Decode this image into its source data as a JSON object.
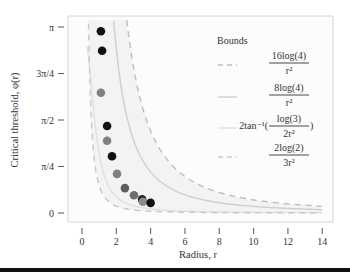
{
  "chart_data": {
    "type": "scatter",
    "title": "",
    "xlabel": "Radius, r",
    "ylabel": "Critical threshold, φ(r)",
    "xlim": [
      -0.8,
      14.6
    ],
    "ylim": [
      -0.15,
      3.26
    ],
    "xticks": [
      0,
      2,
      4,
      6,
      8,
      10,
      12,
      14
    ],
    "xtick_labels": [
      "0",
      "2",
      "4",
      "6",
      "8",
      "10",
      "12",
      "14"
    ],
    "yticks": [
      0,
      0.7854,
      1.5708,
      2.3562,
      3.1416
    ],
    "ytick_labels": [
      "0",
      "π/4",
      "π/2",
      "3π/4",
      "π"
    ],
    "grid": false,
    "legend": {
      "title": "Bounds",
      "position": "upper right",
      "entries": [
        {
          "label_num": "16log(4)",
          "label_den": "r²",
          "prefix": "",
          "suffix": "",
          "style": "dashed",
          "color": "#bdbdbd"
        },
        {
          "label_num": "8log(4)",
          "label_den": "r²",
          "prefix": "",
          "suffix": "",
          "style": "solid",
          "color": "#cfcfcf"
        },
        {
          "label_num": "log(3)",
          "label_den": "2r²",
          "prefix": "2tan⁻¹(",
          "suffix": ")",
          "style": "solid",
          "color": "#e0e0e0"
        },
        {
          "label_num": "2log(2)",
          "label_den": "3r²",
          "prefix": "",
          "suffix": "",
          "style": "dashed",
          "color": "#c8c8c8"
        }
      ]
    },
    "curves": [
      {
        "name": "16log(4)/r^2",
        "formula": "16*ln(4)/r^2",
        "style": "dashed",
        "color": "#bdbdbd"
      },
      {
        "name": "8log(4)/r^2",
        "formula": "8*ln(4)/r^2",
        "style": "solid",
        "color": "#cfcfcf"
      },
      {
        "name": "2tan^-1(log(3)/(2r^2))",
        "formula": "2*atan(ln(3)/(2r^2))",
        "style": "solid",
        "color": "#e0e0e0"
      },
      {
        "name": "2log(2)/(3r^2)",
        "formula": "2*ln(2)/(3r^2)",
        "style": "dashed",
        "color": "#c8c8c8"
      }
    ],
    "shaded_band": {
      "between": [
        "2log(2)/(3r^2)",
        "16log(4)/r^2"
      ],
      "color": "#f3f3f3"
    },
    "points": [
      {
        "r": 1.1,
        "phi": 3.07,
        "color": "#111111"
      },
      {
        "r": 1.17,
        "phi": 2.74,
        "color": "#111111"
      },
      {
        "r": 1.1,
        "phi": 2.03,
        "color": "#808080"
      },
      {
        "r": 1.46,
        "phi": 1.47,
        "color": "#111111"
      },
      {
        "r": 1.46,
        "phi": 1.22,
        "color": "#808080"
      },
      {
        "r": 1.75,
        "phi": 0.96,
        "color": "#111111"
      },
      {
        "r": 2.04,
        "phi": 0.66,
        "color": "#808080"
      },
      {
        "r": 2.5,
        "phi": 0.42,
        "color": "#5e5e5e"
      },
      {
        "r": 3.03,
        "phi": 0.3,
        "color": "#6e6e6e"
      },
      {
        "r": 3.5,
        "phi": 0.23,
        "color": "#222222"
      },
      {
        "r": 3.55,
        "phi": 0.19,
        "color": "#8a8a8a"
      },
      {
        "r": 4.0,
        "phi": 0.17,
        "color": "#111111"
      }
    ]
  }
}
